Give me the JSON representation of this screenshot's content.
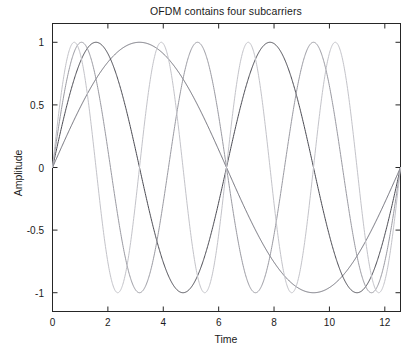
{
  "chart_data": {
    "type": "line",
    "title": "OFDM contains four subcarriers",
    "xlabel": "Time",
    "ylabel": "Amplitude",
    "xlim": [
      0,
      12.566370614359172
    ],
    "ylim": [
      -1.15,
      1.15
    ],
    "xticks": [
      0,
      2,
      4,
      6,
      8,
      10,
      12
    ],
    "xtick_labels": [
      "0",
      "2",
      "4",
      "6",
      "8",
      "10",
      "12"
    ],
    "yticks": [
      1,
      0.5,
      0,
      -0.5,
      -1
    ],
    "ytick_labels": [
      "1",
      "0.5",
      "0",
      "-0.5",
      "-1"
    ],
    "grid": false,
    "legend": "none",
    "box": true,
    "background": "#ffffff",
    "axis_color": "#262626",
    "series": [
      {
        "name": "subcarrier-1",
        "formula": "sin(0.5*t)",
        "harmonic": 1,
        "cycles": 1,
        "color": "#6e6e78",
        "peaks_t": [
          3.14159
        ],
        "troughs_t": [
          9.42478
        ],
        "amplitude": 1
      },
      {
        "name": "subcarrier-2",
        "formula": "sin(1.0*t)",
        "harmonic": 2,
        "cycles": 2,
        "color": "#4a4a52",
        "peaks_t": [
          1.5708,
          7.85398
        ],
        "troughs_t": [
          4.71239,
          10.99557
        ],
        "amplitude": 1
      },
      {
        "name": "subcarrier-3",
        "formula": "sin(1.5*t)",
        "harmonic": 3,
        "cycles": 3,
        "color": "#9a9aa2",
        "peaks_t": [
          1.0472,
          5.23599,
          9.42478
        ],
        "troughs_t": [
          3.14159,
          7.33038,
          11.51917
        ],
        "amplitude": 1
      },
      {
        "name": "subcarrier-4",
        "formula": "sin(2.0*t)",
        "harmonic": 4,
        "cycles": 4,
        "color": "#c3c3c9",
        "peaks_t": [
          0.7854,
          3.92699,
          7.06858,
          10.21018
        ],
        "troughs_t": [
          2.35619,
          5.49779,
          8.63938,
          11.78097
        ],
        "amplitude": 1
      }
    ]
  }
}
